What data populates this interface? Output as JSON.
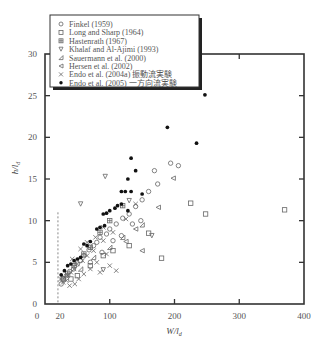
{
  "chart_data": {
    "type": "scatter",
    "title": "",
    "xlabel": "W/l_d",
    "ylabel": "h/l_d",
    "xlim": [
      0,
      400
    ],
    "ylim": [
      0,
      30
    ],
    "xticks": [
      0,
      100,
      200,
      300,
      400
    ],
    "xtick_labels": [
      "0",
      "100",
      "200",
      "300",
      "400"
    ],
    "extra_xtick_label": {
      "value": 20,
      "label": "20"
    },
    "yticks": [
      0,
      5,
      10,
      15,
      20,
      25,
      30
    ],
    "ytick_labels": [
      "0",
      "5",
      "10",
      "15",
      "20",
      "25",
      "30"
    ],
    "grid": false,
    "legend_position": "top-left",
    "reference_line": {
      "type": "vertical-dashed",
      "x": 20,
      "y_range": [
        0,
        11
      ]
    },
    "series": [
      {
        "name": "Finkel (1959)",
        "marker": "circle",
        "points": [
          [
            194,
            16.9
          ],
          [
            206,
            16.6
          ],
          [
            169,
            16.0
          ],
          [
            174,
            14.4
          ],
          [
            160,
            13.5
          ],
          [
            150,
            12.5
          ],
          [
            140,
            11.7
          ],
          [
            130,
            10.8
          ],
          [
            120,
            10.3
          ],
          [
            110,
            9.6
          ],
          [
            100,
            9.0
          ],
          [
            95,
            8.4
          ],
          [
            85,
            8.0
          ],
          [
            80,
            7.4
          ],
          [
            75,
            7.0
          ],
          [
            68,
            6.5
          ],
          [
            60,
            5.8
          ],
          [
            55,
            5.2
          ],
          [
            50,
            4.8
          ],
          [
            44,
            4.2
          ],
          [
            38,
            3.9
          ],
          [
            33,
            3.4
          ],
          [
            28,
            3.0
          ],
          [
            25,
            2.4
          ],
          [
            148,
            10.0
          ],
          [
            135,
            9.6
          ],
          [
            118,
            8.2
          ],
          [
            105,
            7.6
          ],
          [
            88,
            6.2
          ],
          [
            70,
            5.0
          ]
        ]
      },
      {
        "name": "Long and Sharp (1964)",
        "marker": "square",
        "points": [
          [
            225,
            12.1
          ],
          [
            248,
            10.8
          ],
          [
            370,
            11.3
          ],
          [
            180,
            5.5
          ],
          [
            160,
            8.5
          ],
          [
            130,
            7.0
          ],
          [
            105,
            6.4
          ],
          [
            90,
            5.8
          ],
          [
            70,
            4.6
          ],
          [
            50,
            3.4
          ],
          [
            40,
            3.0
          ]
        ]
      },
      {
        "name": "Hastenrath (1967)",
        "marker": "square-plus",
        "points": [
          [
            120,
            11.8
          ],
          [
            100,
            10.0
          ],
          [
            85,
            8.6
          ],
          [
            70,
            6.8
          ],
          [
            60,
            6.0
          ],
          [
            45,
            4.6
          ],
          [
            35,
            3.6
          ],
          [
            28,
            3.0
          ]
        ]
      },
      {
        "name": "Khalaf and Al-Ajimi (1993)",
        "marker": "triangle-down",
        "points": [
          [
            93,
            15.3
          ],
          [
            55,
            12.0
          ],
          [
            130,
            12.4
          ],
          [
            165,
            8.2
          ],
          [
            90,
            4.1
          ]
        ]
      },
      {
        "name": "Sauermann et al. (2000)",
        "marker": "triangle-right-corner",
        "points": [
          [
            150,
            9.5
          ],
          [
            120,
            8.0
          ],
          [
            100,
            6.8
          ],
          [
            75,
            5.6
          ],
          [
            55,
            4.2
          ]
        ]
      },
      {
        "name": "Hersen et al. (2002)",
        "marker": "triangle-left",
        "points": [
          [
            198,
            15.1
          ],
          [
            175,
            11.6
          ],
          [
            150,
            6.4
          ],
          [
            140,
            9.0
          ],
          [
            125,
            7.5
          ]
        ]
      },
      {
        "name": "Endo et al. (2004a) 振動流実験",
        "marker": "x",
        "points": [
          [
            105,
            8.6
          ],
          [
            90,
            7.6
          ],
          [
            75,
            6.4
          ],
          [
            65,
            5.8
          ],
          [
            58,
            5.2
          ],
          [
            50,
            4.8
          ],
          [
            45,
            4.2
          ],
          [
            40,
            3.8
          ],
          [
            35,
            3.4
          ],
          [
            30,
            3.2
          ],
          [
            28,
            2.6
          ],
          [
            24,
            3.0
          ],
          [
            110,
            4.0
          ],
          [
            100,
            4.6
          ],
          [
            85,
            3.8
          ],
          [
            70,
            4.2
          ],
          [
            60,
            3.6
          ],
          [
            52,
            3.0
          ],
          [
            46,
            2.4
          ],
          [
            38,
            2.2
          ],
          [
            33,
            2.8
          ],
          [
            42,
            5.4
          ],
          [
            55,
            6.6
          ],
          [
            65,
            7.4
          ],
          [
            78,
            8.0
          ],
          [
            90,
            9.2
          ],
          [
            125,
            10.2
          ],
          [
            140,
            12.0
          ],
          [
            80,
            5.0
          ],
          [
            95,
            6.0
          ]
        ]
      },
      {
        "name": "Endo et al. (2005) 一方向流実験",
        "marker": "filled-circle",
        "points": [
          [
            247,
            25.1
          ],
          [
            189,
            21.2
          ],
          [
            234,
            19.3
          ],
          [
            133,
            17.5
          ],
          [
            140,
            16.0
          ],
          [
            128,
            15.0
          ],
          [
            118,
            13.5
          ],
          [
            124,
            13.5
          ],
          [
            133,
            13.5
          ],
          [
            150,
            13.2
          ],
          [
            108,
            11.5
          ],
          [
            112,
            11.8
          ],
          [
            118,
            12.0
          ],
          [
            128,
            11.2
          ],
          [
            90,
            10.8
          ],
          [
            95,
            10.9
          ],
          [
            100,
            11.2
          ],
          [
            80,
            9.0
          ],
          [
            85,
            9.2
          ],
          [
            92,
            9.4
          ],
          [
            60,
            7.2
          ],
          [
            65,
            7.0
          ],
          [
            70,
            7.5
          ],
          [
            50,
            5.4
          ],
          [
            55,
            5.6
          ],
          [
            45,
            5.2
          ],
          [
            35,
            4.6
          ],
          [
            40,
            4.8
          ],
          [
            30,
            4.0
          ],
          [
            25,
            3.5
          ]
        ]
      }
    ]
  }
}
